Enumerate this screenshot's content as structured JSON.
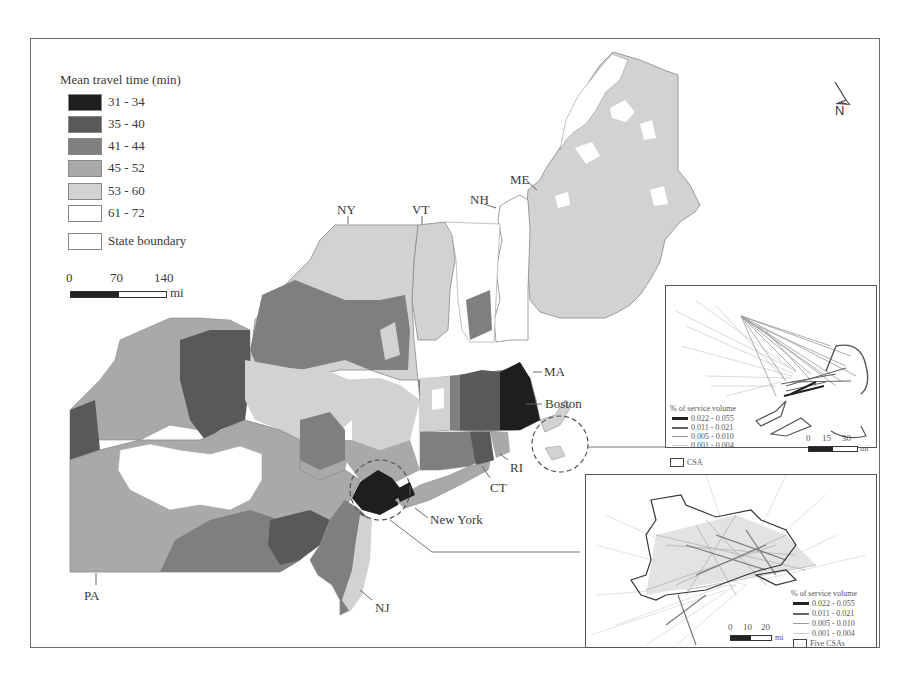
{
  "legend": {
    "title": "Mean travel time (min)",
    "classes": [
      {
        "label": "31 - 34",
        "color": "#1e1e1e"
      },
      {
        "label": "35 - 40",
        "color": "#595959"
      },
      {
        "label": "41 - 44",
        "color": "#7f7f7f"
      },
      {
        "label": "45 - 52",
        "color": "#a9a9a9"
      },
      {
        "label": "53 - 60",
        "color": "#d2d2d2"
      },
      {
        "label": "61 - 72",
        "color": "#ffffff"
      }
    ],
    "boundary_label": "State boundary"
  },
  "scale_main": {
    "ticks": [
      "0",
      "70",
      "140"
    ],
    "unit": "mi"
  },
  "north_arrow": {
    "label": "N"
  },
  "state_labels": {
    "ny": "NY",
    "vt": "VT",
    "nh": "NH",
    "me": "ME",
    "ma": "MA",
    "ri": "RI",
    "ct": "CT",
    "nj": "NJ",
    "pa": "PA"
  },
  "city_labels": {
    "boston": "Boston",
    "new_york": "New York"
  },
  "inset_boston": {
    "legend_title": "% of service volume",
    "classes": [
      "0.022 - 0.055",
      "0.011 - 0.021",
      "0.005 - 0.010",
      "0.001 - 0.004"
    ],
    "area_label": "CSA",
    "scale": {
      "ticks": [
        "0",
        "15",
        "30"
      ],
      "unit": "mi"
    }
  },
  "inset_newyork": {
    "legend_title": "% of service volume",
    "classes": [
      "0.022 - 0.055",
      "0.011 - 0.021",
      "0.005 - 0.010",
      "0.001 - 0.004"
    ],
    "area_label": "Five CSAs",
    "scale": {
      "ticks": [
        "0",
        "10",
        "20"
      ],
      "unit": "mi"
    }
  }
}
